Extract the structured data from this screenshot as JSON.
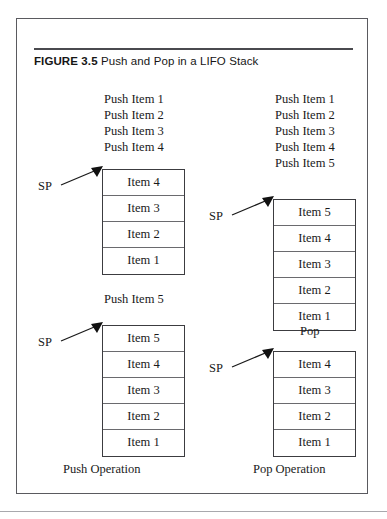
{
  "figure": {
    "label": "FIGURE",
    "number": "3.5",
    "title": "Push and Pop in a LIFO Stack"
  },
  "panels": {
    "push": {
      "stage1": {
        "operations": [
          "Push Item 1",
          "Push Item 2",
          "Push Item 3",
          "Push Item 4"
        ],
        "pointer_label": "SP",
        "stack": [
          "Item 4",
          "Item 3",
          "Item 2",
          "Item 1"
        ]
      },
      "stage2": {
        "operation": "Push Item 5",
        "pointer_label": "SP",
        "stack": [
          "Item 5",
          "Item 4",
          "Item 3",
          "Item 2",
          "Item 1"
        ]
      },
      "caption": "Push Operation"
    },
    "pop": {
      "stage1": {
        "operations": [
          "Push Item 1",
          "Push Item 2",
          "Push Item 3",
          "Push Item 4",
          "Push Item 5"
        ],
        "pointer_label": "SP",
        "stack": [
          "Item 5",
          "Item 4",
          "Item 3",
          "Item 2",
          "Item 1"
        ]
      },
      "stage2": {
        "operation": "Pop",
        "pointer_label": "SP",
        "stack": [
          "Item 4",
          "Item 3",
          "Item 2",
          "Item 1"
        ]
      },
      "caption": "Pop Operation"
    }
  },
  "colors": {
    "frame_border": "#5a5a5f",
    "box_border": "#3c3c40",
    "cell_divider": "#6a6a6e",
    "caption_rule": "#4a4a4f",
    "text": "#1a1a1a",
    "background": "#ffffff"
  }
}
